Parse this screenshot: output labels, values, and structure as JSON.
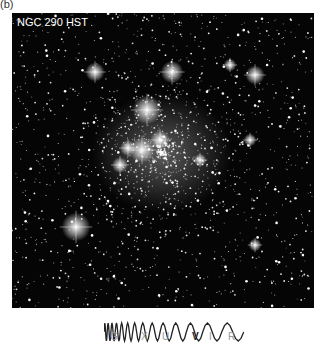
{
  "panel": {
    "label": "(b)"
  },
  "image": {
    "title": "NGC 290 HST",
    "background": "#050505",
    "bright_stars": [
      {
        "x": 147,
        "y": 110,
        "r": 9
      },
      {
        "x": 142,
        "y": 150,
        "r": 8
      },
      {
        "x": 160,
        "y": 140,
        "r": 6
      },
      {
        "x": 128,
        "y": 148,
        "r": 5
      },
      {
        "x": 172,
        "y": 72,
        "r": 7
      },
      {
        "x": 95,
        "y": 72,
        "r": 6
      },
      {
        "x": 76,
        "y": 227,
        "r": 9
      },
      {
        "x": 255,
        "y": 75,
        "r": 6
      },
      {
        "x": 230,
        "y": 65,
        "r": 4
      },
      {
        "x": 200,
        "y": 160,
        "r": 4
      },
      {
        "x": 120,
        "y": 165,
        "r": 5
      },
      {
        "x": 255,
        "y": 245,
        "r": 4
      },
      {
        "x": 250,
        "y": 140,
        "r": 4
      }
    ]
  },
  "wavelength_scale": {
    "bands": [
      {
        "label": "G",
        "selected": false
      },
      {
        "label": "X",
        "selected": false
      },
      {
        "label": "U",
        "selected": false
      },
      {
        "label": "V",
        "selected": true
      },
      {
        "label": "I",
        "selected": false
      },
      {
        "label": "R",
        "selected": false
      }
    ]
  }
}
